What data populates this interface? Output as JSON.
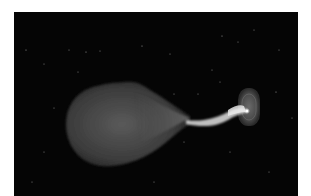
{
  "image": {
    "subject": "Binary star system illustration: a teardrop-shaped donor star transferring mass via a stream to a compact object surrounded by an accretion disk",
    "colors": {
      "background": "#050505",
      "star_dark": "#2e2e2e",
      "star_light": "#7a7a7a",
      "stream": "#d8d8d8",
      "disk": "#4a4a4a",
      "hot_spot": "#ffffff"
    }
  }
}
